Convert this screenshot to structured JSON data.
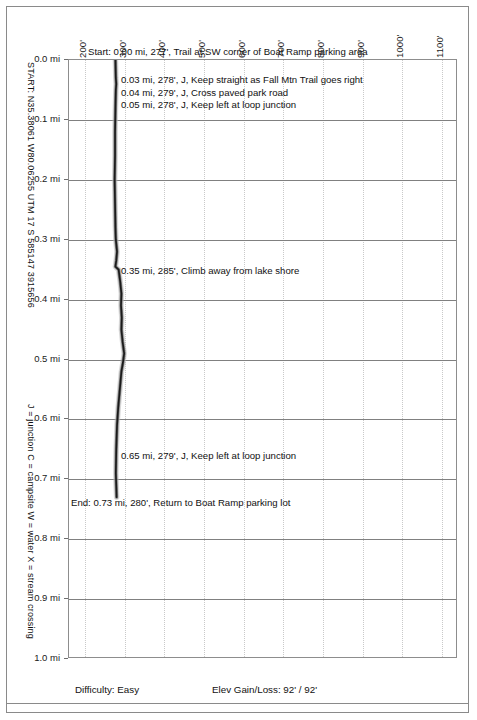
{
  "chart_data": {
    "type": "line",
    "orientation": "vertical",
    "xlabel": "Elevation (feet)",
    "ylabel": "Distance (miles)",
    "xlim": [
      160,
      1140
    ],
    "ylim": [
      0.0,
      1.0
    ],
    "grid": "vertical dotted, horizontal solid",
    "x_ticks": [
      "200'",
      "300'",
      "400'",
      "500'",
      "600'",
      "700'",
      "800'",
      "900'",
      "1000'",
      "1100'"
    ],
    "x_tick_values": [
      200,
      300,
      400,
      500,
      600,
      700,
      800,
      900,
      1000,
      1100
    ],
    "y_ticks": [
      "0.0 mi",
      "0.1 mi",
      "0.2 mi",
      "0.3 mi",
      "0.4 mi",
      "0.5 mi",
      "0.6 mi",
      "0.7 mi",
      "0.8 mi",
      "0.9 mi",
      "1.0 mi"
    ],
    "y_tick_values": [
      0.0,
      0.1,
      0.2,
      0.3,
      0.4,
      0.5,
      0.6,
      0.7,
      0.8,
      0.9,
      1.0
    ],
    "series": [
      {
        "name": "Elevation",
        "color": "#1a1a1a",
        "x_label": "elevation_ft",
        "y_label": "distance_mi",
        "points": [
          {
            "distance_mi": 0.0,
            "elevation_ft": 277
          },
          {
            "distance_mi": 0.03,
            "elevation_ft": 278
          },
          {
            "distance_mi": 0.04,
            "elevation_ft": 279
          },
          {
            "distance_mi": 0.05,
            "elevation_ft": 278
          },
          {
            "distance_mi": 0.08,
            "elevation_ft": 277
          },
          {
            "distance_mi": 0.12,
            "elevation_ft": 276
          },
          {
            "distance_mi": 0.16,
            "elevation_ft": 276
          },
          {
            "distance_mi": 0.2,
            "elevation_ft": 275
          },
          {
            "distance_mi": 0.24,
            "elevation_ft": 276
          },
          {
            "distance_mi": 0.28,
            "elevation_ft": 277
          },
          {
            "distance_mi": 0.3,
            "elevation_ft": 278
          },
          {
            "distance_mi": 0.32,
            "elevation_ft": 281
          },
          {
            "distance_mi": 0.335,
            "elevation_ft": 279
          },
          {
            "distance_mi": 0.345,
            "elevation_ft": 277
          },
          {
            "distance_mi": 0.35,
            "elevation_ft": 285
          },
          {
            "distance_mi": 0.37,
            "elevation_ft": 289
          },
          {
            "distance_mi": 0.39,
            "elevation_ft": 292
          },
          {
            "distance_mi": 0.41,
            "elevation_ft": 291
          },
          {
            "distance_mi": 0.43,
            "elevation_ft": 293
          },
          {
            "distance_mi": 0.45,
            "elevation_ft": 292
          },
          {
            "distance_mi": 0.47,
            "elevation_ft": 295
          },
          {
            "distance_mi": 0.49,
            "elevation_ft": 299
          },
          {
            "distance_mi": 0.505,
            "elevation_ft": 296
          },
          {
            "distance_mi": 0.52,
            "elevation_ft": 292
          },
          {
            "distance_mi": 0.55,
            "elevation_ft": 288
          },
          {
            "distance_mi": 0.58,
            "elevation_ft": 284
          },
          {
            "distance_mi": 0.61,
            "elevation_ft": 281
          },
          {
            "distance_mi": 0.65,
            "elevation_ft": 279
          },
          {
            "distance_mi": 0.69,
            "elevation_ft": 278
          },
          {
            "distance_mi": 0.73,
            "elevation_ft": 280
          }
        ]
      }
    ],
    "annotations": [
      {
        "id": "start",
        "text": "Start: 0.00 mi, 277', Trail at SW corner of Boat Ramp parking area",
        "distance_mi": 0.0
      },
      {
        "id": "wp-003",
        "text": "0.03 mi, 278', J, Keep straight as Fall Mtn Trail goes right",
        "distance_mi": 0.03
      },
      {
        "id": "wp-004",
        "text": "0.04 mi, 279', J, Cross paved park road",
        "distance_mi": 0.04
      },
      {
        "id": "wp-005",
        "text": "0.05 mi, 278', J, Keep left at loop junction",
        "distance_mi": 0.05
      },
      {
        "id": "wp-035",
        "text": "0.35 mi, 285', Climb away from lake shore",
        "distance_mi": 0.35
      },
      {
        "id": "wp-065",
        "text": "0.65 mi, 279', J, Keep left at loop junction",
        "distance_mi": 0.65
      },
      {
        "id": "end",
        "text": "End: 0.73 mi, 280', Return to Boat Ramp parking lot",
        "distance_mi": 0.73
      }
    ]
  },
  "sidebar": {
    "start_coords": "START: N35.38061 W80.06255  UTM 17 S 585147 3915656",
    "legend_key": "J = junction  C = campsite  W = water  X = stream crossing"
  },
  "footer": {
    "difficulty": "Difficulty: Easy",
    "elev_gain_loss": "Elev Gain/Loss: 92' / 92'"
  }
}
